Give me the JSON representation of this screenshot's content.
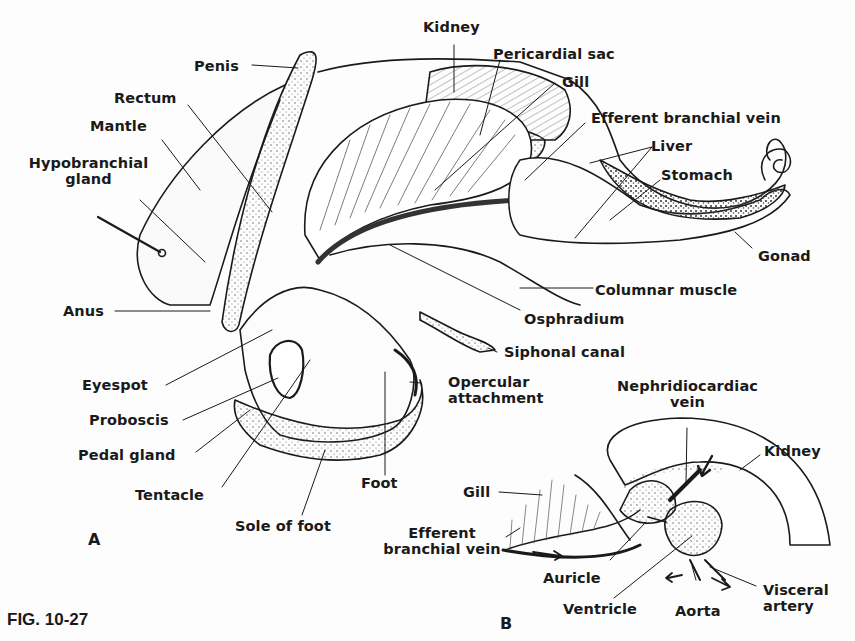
{
  "figure": {
    "id": "FIG. 10-27",
    "panel_a": "A",
    "panel_b": "B"
  },
  "panel_a_labels": {
    "kidney": "Kidney",
    "penis": "Penis",
    "pericardial_sac": "Pericardial sac",
    "gill": "Gill",
    "rectum": "Rectum",
    "mantle": "Mantle",
    "efferent_branchial_vein": "Efferent branchial vein",
    "hypobranchial_gland_1": "Hypobranchial",
    "hypobranchial_gland_2": "gland",
    "liver": "Liver",
    "stomach": "Stomach",
    "gonad": "Gonad",
    "columnar_muscle": "Columnar muscle",
    "anus": "Anus",
    "osphradium": "Osphradium",
    "siphonal_canal": "Siphonal canal",
    "eyespot": "Eyespot",
    "opercular_attachment_1": "Opercular",
    "opercular_attachment_2": "attachment",
    "proboscis": "Proboscis",
    "pedal_gland": "Pedal gland",
    "tentacle": "Tentacle",
    "foot": "Foot",
    "sole_of_foot": "Sole of foot"
  },
  "panel_b_labels": {
    "nephridiocardiac_vein_1": "Nephridiocardiac",
    "nephridiocardiac_vein_2": "vein",
    "kidney": "Kidney",
    "gill": "Gill",
    "efferent_branchial_vein_1": "Efferent",
    "efferent_branchial_vein_2": "branchial vein",
    "auricle": "Auricle",
    "ventricle": "Ventricle",
    "aorta": "Aorta",
    "visceral_artery_1": "Visceral",
    "visceral_artery_2": "artery"
  }
}
